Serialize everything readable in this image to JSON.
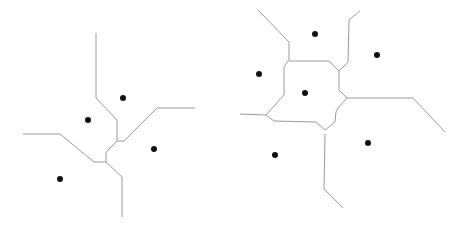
{
  "diagrams": [
    {
      "name": "voronoi-left",
      "sites": [
        [
          123,
          98
        ],
        [
          88,
          120
        ],
        [
          154,
          149
        ],
        [
          60,
          179
        ]
      ],
      "edges": [
        [
          [
            96,
            33
          ],
          [
            96,
            98
          ],
          [
            117,
            120
          ],
          [
            117,
            141
          ],
          [
            124,
            141
          ],
          [
            157,
            108
          ],
          [
            195,
            108
          ]
        ],
        [
          [
            23,
            134
          ],
          [
            60,
            134
          ],
          [
            94,
            162
          ],
          [
            106,
            162
          ],
          [
            106,
            152
          ],
          [
            117,
            141
          ]
        ],
        [
          [
            106,
            162
          ],
          [
            122,
            177
          ],
          [
            122,
            217
          ]
        ]
      ]
    },
    {
      "name": "voronoi-right",
      "sites": [
        [
          315,
          34
        ],
        [
          377,
          55
        ],
        [
          259,
          74
        ],
        [
          305,
          93
        ],
        [
          368,
          143
        ],
        [
          275,
          155
        ]
      ],
      "edges": [
        [
          [
            258,
            10
          ],
          [
            289,
            42
          ],
          [
            289,
            61
          ],
          [
            329,
            61
          ],
          [
            339,
            71
          ],
          [
            339,
            90
          ],
          [
            347,
            98
          ],
          [
            338,
            108
          ],
          [
            336,
            112
          ],
          [
            335,
            122
          ],
          [
            325,
            130
          ]
        ],
        [
          [
            288,
            61
          ],
          [
            284,
            67
          ],
          [
            284,
            95
          ],
          [
            266,
            115
          ],
          [
            274,
            121
          ],
          [
            316,
            122
          ],
          [
            325,
            130
          ]
        ],
        [
          [
            240,
            114
          ],
          [
            266,
            115
          ]
        ],
        [
          [
            339,
            71
          ],
          [
            348,
            62
          ],
          [
            349,
            20
          ],
          [
            360,
            11
          ]
        ],
        [
          [
            347,
            98
          ],
          [
            413,
            98
          ],
          [
            445,
            132
          ]
        ],
        [
          [
            325,
            134
          ],
          [
            324,
            189
          ],
          [
            343,
            208
          ]
        ]
      ]
    }
  ],
  "colors": {
    "edge": "#9a9a9a",
    "site": "#111111",
    "background": "#ffffff"
  }
}
